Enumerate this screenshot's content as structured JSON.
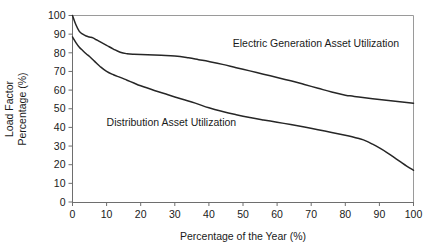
{
  "chart_data": {
    "type": "line",
    "title": "",
    "subtitle": "",
    "xlabel": "Percentage of the Year (%)",
    "ylabel": "Load Factor Percentage (%)",
    "ylabel_line1": "Load Factor",
    "ylabel_line2": "Percentage (%)",
    "xlim": [
      0,
      100
    ],
    "ylim": [
      0,
      100
    ],
    "xticks": [
      0,
      10,
      20,
      30,
      40,
      50,
      60,
      70,
      80,
      90,
      100
    ],
    "xticklabels": [
      "0",
      "10",
      "20",
      "30",
      "40",
      "50",
      "60",
      "70",
      "80",
      "90",
      "100"
    ],
    "yticks": [
      0,
      10,
      20,
      30,
      40,
      50,
      60,
      70,
      80,
      90,
      100
    ],
    "yticklabels": [
      "0",
      "10",
      "20",
      "30",
      "40",
      "50",
      "60",
      "70",
      "80",
      "90",
      "100"
    ],
    "grid": false,
    "legend_position": "inline-annotation",
    "line_color": "#262626",
    "axis_color": "#6e6e6e",
    "frame_color": "#9a9a9a",
    "background_color": "#ffffff",
    "series": [
      {
        "name": "Electric Generation Asset Utilization",
        "label": "Electric Generation Asset Utilization",
        "label_x": 47,
        "label_y": 83,
        "color": "#262626",
        "x": [
          0,
          1,
          2,
          3,
          4,
          5,
          6,
          7,
          8,
          10,
          12,
          14,
          16,
          18,
          22,
          26,
          30,
          34,
          37,
          40,
          44,
          48,
          52,
          56,
          60,
          64,
          68,
          72,
          76,
          80,
          82,
          84,
          88,
          92,
          96,
          100
        ],
        "y": [
          100,
          95,
          91.5,
          90,
          89,
          88.5,
          88,
          87,
          86,
          84,
          82,
          80.3,
          79.5,
          79.2,
          79,
          78.7,
          78.3,
          77.3,
          76.3,
          75.3,
          73.8,
          72,
          70.3,
          68.5,
          66.8,
          65,
          63,
          61,
          59,
          57.3,
          56.8,
          56.3,
          55.4,
          54.6,
          53.8,
          53
        ]
      },
      {
        "name": "Distribution Asset Utilization",
        "label": "Distribution Asset Utilization",
        "label_x": 10,
        "label_y": 41,
        "color": "#262626",
        "x": [
          0,
          1,
          2,
          3,
          4,
          5,
          6,
          7,
          8,
          10,
          12,
          14,
          16,
          18,
          20,
          24,
          28,
          32,
          36,
          40,
          44,
          48,
          52,
          56,
          60,
          64,
          68,
          72,
          76,
          80,
          82,
          84,
          86,
          88,
          90,
          92,
          94,
          96,
          98,
          100
        ],
        "y": [
          88.5,
          85.5,
          83,
          81.2,
          79.5,
          78,
          76.3,
          74.5,
          72.8,
          70,
          68.2,
          66.8,
          65.3,
          63.8,
          62.3,
          59.8,
          57.5,
          55.2,
          53,
          50.5,
          48.5,
          46.8,
          45.3,
          44,
          42.8,
          41.5,
          40.2,
          38.8,
          37.3,
          35.8,
          35,
          34,
          32.8,
          31,
          29,
          26.8,
          24.3,
          21.8,
          19.3,
          17
        ]
      }
    ]
  }
}
